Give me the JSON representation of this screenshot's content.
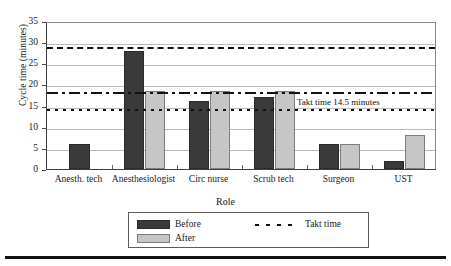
{
  "chart_data": {
    "type": "bar",
    "title": "",
    "xlabel": "Role",
    "ylabel": "Cycle time (minutes)",
    "ylim": [
      0,
      35
    ],
    "ytick_values": [
      0,
      5,
      10,
      15,
      20,
      25,
      30,
      35
    ],
    "ytick_labels": [
      "0",
      "5",
      "10",
      "15",
      "20",
      "25",
      "30",
      "35"
    ],
    "grid": true,
    "legend_position": "bottom-center",
    "categories": [
      "Anesth. tech",
      "Anesthesiologist",
      "Circ nurse",
      "Scrub tech",
      "Surgeon",
      "UST"
    ],
    "series": [
      {
        "name": "Before",
        "color": "#3a3a3a",
        "values": [
          6,
          28,
          16,
          17,
          6,
          2
        ]
      },
      {
        "name": "After",
        "color": "#c6c6c6",
        "values": [
          null,
          18.5,
          18.5,
          18.5,
          6,
          8
        ]
      }
    ],
    "reference_lines": [
      {
        "name": "upper-dashed-line",
        "value": 29,
        "style": "long-dash"
      },
      {
        "name": "mid-dash-dot-line",
        "value": 18.5,
        "style": "dash-dot"
      },
      {
        "name": "takt-time-line",
        "value": 14.5,
        "style": "dotted",
        "label": "Takt time 14.5 minutes"
      }
    ],
    "annotations": [
      {
        "name": "takt-time-annotation",
        "text": "Takt time 14.5 minutes",
        "value": 14.5
      }
    ]
  },
  "legend": {
    "items": [
      {
        "label": "Before",
        "swatch": "before"
      },
      {
        "label": "After",
        "swatch": "after"
      }
    ],
    "line_item": {
      "label": "Takt time",
      "style": "dashed"
    }
  }
}
